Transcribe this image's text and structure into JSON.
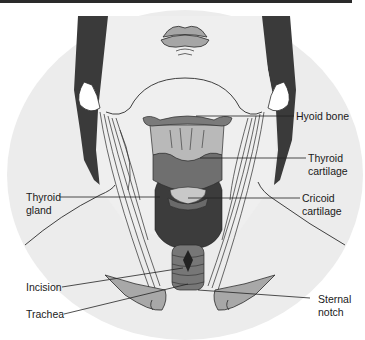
{
  "figure": {
    "colors": {
      "background_shade": "#ececec",
      "skin": "#efefef",
      "hair": "#3a3a3a",
      "outline": "#2b2b2b",
      "hyoid": "#7a7a7a",
      "thyroid_cartilage_light": "#b9b9b9",
      "thyroid_cartilage_dark": "#6f6f6f",
      "thyroid_gland": "#3c3c3c",
      "cricoid": "#6a6a6a",
      "trachea": "#777777",
      "clavicle": "#a8a8a8",
      "lips": "#a6a6a6",
      "label_text": "#1a1a1a",
      "leader_line": "#222222"
    }
  },
  "labels": {
    "hyoid_bone": "Hyoid bone",
    "thyroid_cartilage": "Thyroid\ncartilage",
    "thyroid_gland": "Thyroid\ngland",
    "cricoid_cartilage": "Cricoid\ncartilage",
    "incision": "Incision",
    "trachea": "Trachea",
    "sternal_notch": "Sternal\nnotch"
  }
}
